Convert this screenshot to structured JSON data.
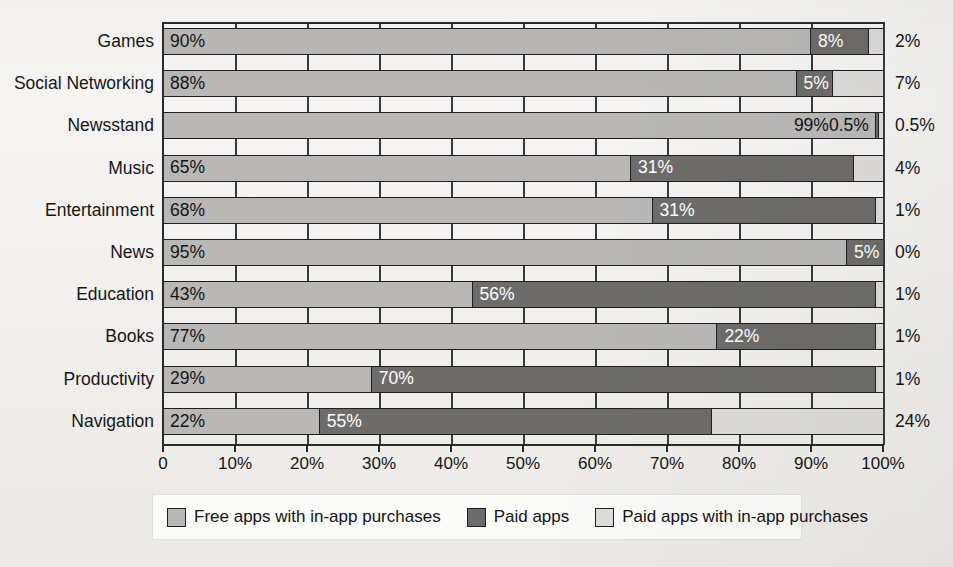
{
  "chart_data": {
    "type": "bar",
    "orientation": "horizontal",
    "stacked": true,
    "title": "",
    "xlabel": "",
    "ylabel": "",
    "xlim": [
      0,
      100
    ],
    "grid": true,
    "legend_position": "bottom",
    "categories": [
      "Games",
      "Social Networking",
      "Newsstand",
      "Music",
      "Entertainment",
      "News",
      "Education",
      "Books",
      "Productivity",
      "Navigation"
    ],
    "series": [
      {
        "name": "Free apps with in-app purchases",
        "color": "#b9b8b6",
        "values": [
          90,
          88,
          99,
          65,
          68,
          95,
          43,
          77,
          29,
          22
        ],
        "labels": [
          "90%",
          "88%",
          "99%",
          "65%",
          "68%",
          "95%",
          "43%",
          "77%",
          "29%",
          "22%"
        ]
      },
      {
        "name": "Paid apps",
        "color": "#6d6c6a",
        "values": [
          8,
          5,
          0.5,
          31,
          31,
          5,
          56,
          22,
          70,
          55
        ],
        "labels": [
          "8%",
          "5%",
          "0.5%",
          "31%",
          "31%",
          "5%",
          "56%",
          "22%",
          "70%",
          "55%"
        ]
      },
      {
        "name": "Paid apps with in-app purchases",
        "color": "#dddcda",
        "values": [
          2,
          7,
          0.5,
          4,
          1,
          0,
          1,
          1,
          1,
          24
        ],
        "labels": [
          "2%",
          "7%",
          "0.5%",
          "4%",
          "1%",
          "0%",
          "1%",
          "1%",
          "1%",
          "24%"
        ]
      }
    ],
    "xticks": [
      0,
      10,
      20,
      30,
      40,
      50,
      60,
      70,
      80,
      90,
      100
    ],
    "xtick_labels": [
      "0",
      "10%",
      "20%",
      "30%",
      "40%",
      "50%",
      "60%",
      "70%",
      "80%",
      "90%",
      "100%"
    ]
  },
  "rows": [
    {
      "category": "Games",
      "free": 90,
      "paid": 8,
      "paid_iap": 2,
      "free_label": "90%",
      "paid_label": "8%",
      "right_label": "2%",
      "paid_label_inside": true,
      "paid_iap_label_inside": false
    },
    {
      "category": "Social Networking",
      "free": 88,
      "paid": 5,
      "paid_iap": 7,
      "free_label": "88%",
      "paid_label": "5%",
      "right_label": "7%",
      "paid_label_inside": true,
      "paid_iap_label_inside": false
    },
    {
      "category": "Newsstand",
      "free": 99,
      "paid": 0.5,
      "paid_iap": 0.5,
      "free_label": "99%",
      "paid_label": "0.5%",
      "right_label": "0.5%",
      "paid_label_inside": false,
      "paid_iap_label_inside": false
    },
    {
      "category": "Music",
      "free": 65,
      "paid": 31,
      "paid_iap": 4,
      "free_label": "65%",
      "paid_label": "31%",
      "right_label": "4%",
      "paid_label_inside": true,
      "paid_iap_label_inside": false
    },
    {
      "category": "Entertainment",
      "free": 68,
      "paid": 31,
      "paid_iap": 1,
      "free_label": "68%",
      "paid_label": "31%",
      "right_label": "1%",
      "paid_label_inside": true,
      "paid_iap_label_inside": false
    },
    {
      "category": "News",
      "free": 95,
      "paid": 5,
      "paid_iap": 0,
      "free_label": "95%",
      "paid_label": "5%",
      "right_label": "0%",
      "paid_label_inside": true,
      "paid_iap_label_inside": false
    },
    {
      "category": "Education",
      "free": 43,
      "paid": 56,
      "paid_iap": 1,
      "free_label": "43%",
      "paid_label": "56%",
      "right_label": "1%",
      "paid_label_inside": true,
      "paid_iap_label_inside": false
    },
    {
      "category": "Books",
      "free": 77,
      "paid": 22,
      "paid_iap": 1,
      "free_label": "77%",
      "paid_label": "22%",
      "right_label": "1%",
      "paid_label_inside": true,
      "paid_iap_label_inside": false
    },
    {
      "category": "Productivity",
      "free": 29,
      "paid": 70,
      "paid_iap": 1,
      "free_label": "29%",
      "paid_label": "70%",
      "right_label": "1%",
      "paid_label_inside": true,
      "paid_iap_label_inside": false
    },
    {
      "category": "Navigation",
      "free": 22,
      "paid": 55,
      "paid_iap": 24,
      "free_label": "22%",
      "paid_label": "55%",
      "right_label": "24%",
      "paid_label_inside": true,
      "paid_iap_label_inside": false
    }
  ],
  "legend": {
    "items": [
      {
        "label": "Free apps with in-app purchases",
        "color": "#b9b8b6",
        "swatch_class": "seg-free"
      },
      {
        "label": "Paid apps",
        "color": "#6d6c6a",
        "swatch_class": "seg-paid"
      },
      {
        "label": "Paid apps with in-app purchases",
        "color": "#dddcda",
        "swatch_class": "seg-paidiap"
      }
    ]
  }
}
